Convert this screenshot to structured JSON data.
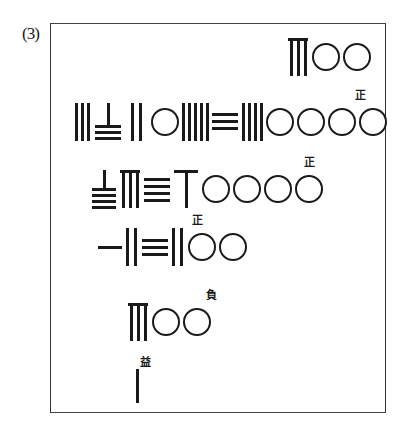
{
  "figure": {
    "label": "(3)",
    "notation": "Chinese counting-rod numerals",
    "rows": [
      {
        "id": "row1",
        "rods": [
          "8",
          "0",
          "0"
        ],
        "value": "800",
        "tag": null
      },
      {
        "id": "row2",
        "rods": [
          "3",
          "7",
          "2",
          "0",
          "5",
          "3",
          "4",
          "0",
          "0",
          "0",
          "0"
        ],
        "value": "37205340000",
        "tag": "正"
      },
      {
        "id": "row3",
        "rods": [
          "9",
          "8",
          "4",
          "6",
          "0",
          "0",
          "0",
          "0"
        ],
        "value": "98460000",
        "tag": "正"
      },
      {
        "id": "row4",
        "rods": [
          "1",
          "2",
          "3",
          "2",
          "0",
          "0"
        ],
        "value": "123200",
        "tag": "正"
      },
      {
        "id": "row5",
        "rods": [
          "8",
          "0",
          "0"
        ],
        "value": "800",
        "tag": "負"
      },
      {
        "id": "row6",
        "rods": [
          "1"
        ],
        "value": "1",
        "tag": "益"
      }
    ]
  }
}
